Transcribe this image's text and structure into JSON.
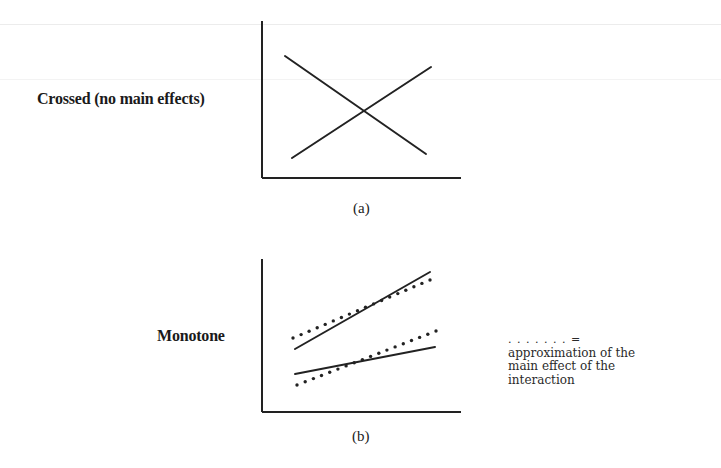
{
  "figure": {
    "panels": [
      {
        "id": "a",
        "label": "Crossed (no main effects)",
        "caption": "(a)",
        "axes": {
          "y_axis": {
            "x": 262,
            "y1": 21,
            "y2": 178
          },
          "x_axis": {
            "y": 178,
            "x1": 262,
            "x2": 461
          }
        },
        "lines": [
          {
            "name": "decreasing-line",
            "style": "solid",
            "x1": 285,
            "y1": 56,
            "x2": 426,
            "y2": 154
          },
          {
            "name": "increasing-line",
            "style": "solid",
            "x1": 292,
            "y1": 158,
            "x2": 431,
            "y2": 67
          }
        ]
      },
      {
        "id": "b",
        "label": "Monotone",
        "caption": "(b)",
        "axes": {
          "y_axis": {
            "x": 262,
            "y1": 259,
            "y2": 412
          },
          "x_axis": {
            "y": 412,
            "x1": 262,
            "x2": 461
          }
        },
        "lines": [
          {
            "name": "upper-solid-line",
            "style": "solid",
            "x1": 295,
            "y1": 349,
            "x2": 430,
            "y2": 272
          },
          {
            "name": "upper-dotted-line",
            "style": "dotted",
            "x1": 293,
            "y1": 338,
            "x2": 430,
            "y2": 280
          },
          {
            "name": "lower-solid-line",
            "style": "solid",
            "x1": 295,
            "y1": 374,
            "x2": 435,
            "y2": 347
          },
          {
            "name": "lower-dotted-line",
            "style": "dotted",
            "x1": 297,
            "y1": 385,
            "x2": 436,
            "y2": 331
          }
        ]
      }
    ],
    "legend": {
      "key": ". . . . . . . =",
      "lines": [
        "approximation of the",
        "main effect of the",
        "interaction"
      ]
    },
    "colors": {
      "ink": "#222222",
      "background": "#ffffff"
    }
  }
}
